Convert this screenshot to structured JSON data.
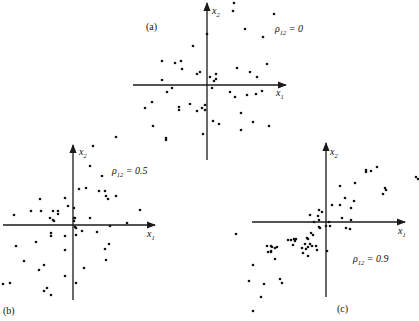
{
  "chart_data": [
    {
      "type": "scatter",
      "panel_label": "(a)",
      "title": "",
      "xlabel": "x1",
      "ylabel": "x2",
      "annotation": "ρ12 = 0",
      "rho_symbol": "ρ",
      "rho_sub": "12",
      "rho_value": "0",
      "grid": false,
      "origin_px": [
        207,
        85
      ],
      "x_axis_px": [
        133,
        286
      ],
      "y_axis_px": [
        3,
        160
      ],
      "points_px": [
        [
          234,
          3
        ],
        [
          233,
          11
        ],
        [
          274,
          14
        ],
        [
          245,
          29
        ],
        [
          263,
          37
        ],
        [
          207,
          34
        ],
        [
          193,
          46
        ],
        [
          162,
          61
        ],
        [
          175,
          63
        ],
        [
          181,
          61
        ],
        [
          182,
          69
        ],
        [
          237,
          68
        ],
        [
          267,
          64
        ],
        [
          250,
          72
        ],
        [
          197,
          74
        ],
        [
          200,
          72
        ],
        [
          210,
          77
        ],
        [
          216,
          74
        ],
        [
          216,
          79
        ],
        [
          214,
          81
        ],
        [
          257,
          77
        ],
        [
          162,
          80
        ],
        [
          172,
          88
        ],
        [
          167,
          92
        ],
        [
          212,
          88
        ],
        [
          230,
          92
        ],
        [
          235,
          97
        ],
        [
          247,
          95
        ],
        [
          256,
          94
        ],
        [
          262,
          91
        ],
        [
          145,
          108
        ],
        [
          152,
          102
        ],
        [
          179,
          107
        ],
        [
          179,
          110
        ],
        [
          190,
          104
        ],
        [
          197,
          111
        ],
        [
          202,
          108
        ],
        [
          205,
          105
        ],
        [
          205,
          110
        ],
        [
          213,
          121
        ],
        [
          219,
          124
        ],
        [
          241,
          113
        ],
        [
          253,
          122
        ],
        [
          153,
          126
        ],
        [
          166,
          138
        ],
        [
          203,
          134
        ],
        [
          241,
          130
        ],
        [
          269,
          126
        ]
      ],
      "n_points": 48
    },
    {
      "type": "scatter",
      "panel_label": "(b)",
      "title": "",
      "xlabel": "x1",
      "ylabel": "x2",
      "annotation": "ρ12 = 0.5",
      "rho_symbol": "ρ",
      "rho_sub": "12",
      "rho_value": "0.5",
      "grid": false,
      "origin_px": [
        73,
        225
      ],
      "x_axis_px": [
        3,
        155
      ],
      "y_axis_px": [
        145,
        300
      ],
      "points_px": [
        [
          116,
          137
        ],
        [
          166,
          140
        ],
        [
          93,
          146
        ],
        [
          90,
          166
        ],
        [
          102,
          176
        ],
        [
          79,
          189
        ],
        [
          86,
          188
        ],
        [
          99,
          191
        ],
        [
          105,
          191
        ],
        [
          116,
          196
        ],
        [
          108,
          199
        ],
        [
          106,
          196
        ],
        [
          40,
          199
        ],
        [
          65,
          198
        ],
        [
          68,
          206
        ],
        [
          74,
          208
        ],
        [
          74,
          218
        ],
        [
          53,
          211
        ],
        [
          41,
          211
        ],
        [
          50,
          218
        ],
        [
          58,
          211
        ],
        [
          31,
          211
        ],
        [
          58,
          214
        ],
        [
          14,
          215
        ],
        [
          53,
          220
        ],
        [
          54,
          221
        ],
        [
          90,
          218
        ],
        [
          140,
          210
        ],
        [
          75,
          218
        ],
        [
          74,
          221
        ],
        [
          127,
          223
        ],
        [
          110,
          226
        ],
        [
          75,
          227
        ],
        [
          76,
          228
        ],
        [
          82,
          231
        ],
        [
          97,
          232
        ],
        [
          51,
          233
        ],
        [
          51,
          236
        ],
        [
          65,
          236
        ],
        [
          76,
          235
        ],
        [
          16,
          246
        ],
        [
          36,
          242
        ],
        [
          65,
          250
        ],
        [
          109,
          244
        ],
        [
          105,
          249
        ],
        [
          106,
          260
        ],
        [
          24,
          261
        ],
        [
          44,
          265
        ],
        [
          39,
          270
        ],
        [
          84,
          268
        ],
        [
          65,
          276
        ],
        [
          3,
          284
        ],
        [
          10,
          283
        ],
        [
          47,
          288
        ],
        [
          44,
          291
        ],
        [
          51,
          295
        ],
        [
          76,
          283
        ]
      ],
      "n_points": 57
    },
    {
      "type": "scatter",
      "panel_label": "(c)",
      "title": "",
      "xlabel": "x1",
      "ylabel": "x2",
      "annotation": "ρ12 = 0.9",
      "rho_symbol": "ρ",
      "rho_sub": "12",
      "rho_value": "0.9",
      "grid": false,
      "origin_px": [
        326,
        222
      ],
      "x_axis_px": [
        252,
        405
      ],
      "y_axis_px": [
        143,
        297
      ],
      "points_px": [
        [
          366,
          170
        ],
        [
          366,
          172
        ],
        [
          371,
          171
        ],
        [
          377,
          167
        ],
        [
          416,
          177
        ],
        [
          418,
          179
        ],
        [
          340,
          186
        ],
        [
          355,
          183
        ],
        [
          385,
          188
        ],
        [
          386,
          190
        ],
        [
          383,
          194
        ],
        [
          345,
          198
        ],
        [
          354,
          201
        ],
        [
          332,
          205
        ],
        [
          340,
          205
        ],
        [
          351,
          208
        ],
        [
          319,
          210
        ],
        [
          322,
          212
        ],
        [
          318,
          216
        ],
        [
          310,
          215
        ],
        [
          319,
          220
        ],
        [
          314,
          222
        ],
        [
          329,
          222
        ],
        [
          342,
          218
        ],
        [
          351,
          220
        ],
        [
          346,
          228
        ],
        [
          350,
          229
        ],
        [
          319,
          227
        ],
        [
          320,
          228
        ],
        [
          326,
          226
        ],
        [
          330,
          226
        ],
        [
          311,
          233
        ],
        [
          313,
          235
        ],
        [
          236,
          234
        ],
        [
          288,
          240
        ],
        [
          291,
          240
        ],
        [
          294,
          239
        ],
        [
          296,
          239
        ],
        [
          277,
          247
        ],
        [
          293,
          245
        ],
        [
          295,
          241
        ],
        [
          307,
          238
        ],
        [
          308,
          239
        ],
        [
          305,
          244
        ],
        [
          310,
          244
        ],
        [
          308,
          247
        ],
        [
          312,
          246
        ],
        [
          316,
          246
        ],
        [
          302,
          248
        ],
        [
          306,
          249
        ],
        [
          317,
          250
        ],
        [
          303,
          253
        ],
        [
          308,
          256
        ],
        [
          271,
          246
        ],
        [
          272,
          247
        ],
        [
          267,
          246
        ],
        [
          275,
          248
        ],
        [
          268,
          252
        ],
        [
          271,
          251
        ],
        [
          327,
          251
        ],
        [
          271,
          252
        ],
        [
          275,
          259
        ],
        [
          253,
          265
        ],
        [
          249,
          281
        ],
        [
          264,
          284
        ],
        [
          280,
          279
        ],
        [
          282,
          283
        ],
        [
          261,
          297
        ],
        [
          253,
          311
        ]
      ],
      "n_points": 69
    }
  ]
}
